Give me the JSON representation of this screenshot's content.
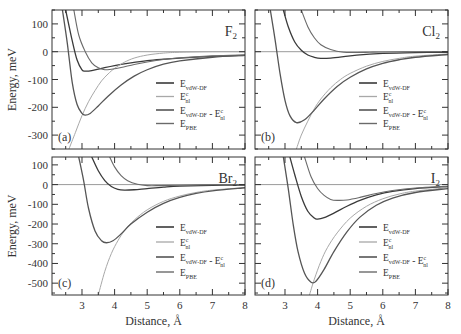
{
  "chart_data": [
    {
      "type": "line",
      "panel_tag": "(a)",
      "molecule": "F",
      "molecule_sub": "2",
      "xlim": [
        2.08,
        8
      ],
      "ylim": [
        -350,
        150
      ],
      "yticks": [
        100,
        0,
        -100,
        -200,
        -300
      ],
      "xticks": [
        3,
        4,
        5,
        6,
        7,
        8
      ],
      "show_x_tick_labels": false,
      "show_y_tick_labels": true,
      "ylabel": "Energy, meV",
      "series": [
        {
          "name": "E_vdW-DF",
          "x": [
            2.5,
            2.7,
            2.85,
            3.0,
            3.1,
            3.3,
            3.6,
            4.0,
            4.5,
            5.0,
            5.5,
            6.0,
            7.0,
            8.0
          ],
          "values": [
            150,
            40,
            -30,
            -65,
            -70,
            -68,
            -60,
            -50,
            -40,
            -32,
            -27,
            -23,
            -17,
            -13
          ]
        },
        {
          "name": "E_nl^c",
          "x": [
            2.6,
            2.8,
            3.0,
            3.2,
            3.4,
            3.6,
            3.8,
            4.0,
            4.3,
            4.6,
            5.0,
            5.5,
            6.0,
            7.0,
            8.0
          ],
          "values": [
            -350,
            -290,
            -230,
            -180,
            -140,
            -105,
            -80,
            -60,
            -38,
            -23,
            -12,
            -5,
            -2,
            0,
            0
          ]
        },
        {
          "name": "E_vdW-DF - E_nl^c",
          "x": [
            2.4,
            2.55,
            2.7,
            2.85,
            3.0,
            3.1,
            3.25,
            3.5,
            3.8,
            4.2,
            4.6,
            5.0,
            5.5,
            6.0,
            7.0,
            8.0
          ],
          "values": [
            150,
            30,
            -110,
            -190,
            -222,
            -228,
            -222,
            -195,
            -160,
            -120,
            -88,
            -65,
            -45,
            -33,
            -20,
            -13
          ]
        },
        {
          "name": "E_PBE",
          "x": [
            2.75,
            2.9,
            3.1,
            3.3,
            3.5,
            3.7,
            3.9,
            4.2,
            4.6,
            5.0,
            5.5,
            6.0,
            7.0,
            8.0
          ],
          "values": [
            150,
            60,
            0,
            -40,
            -58,
            -65,
            -63,
            -57,
            -46,
            -37,
            -28,
            -22,
            -15,
            -11
          ]
        }
      ],
      "zero_line": true,
      "legend": "center-right"
    },
    {
      "type": "line",
      "panel_tag": "(b)",
      "molecule": "Cl",
      "molecule_sub": "2",
      "xlim": [
        2.08,
        8
      ],
      "ylim": [
        -350,
        150
      ],
      "yticks": [
        100,
        0,
        -100,
        -200,
        -300
      ],
      "xticks": [
        3,
        4,
        5,
        6,
        7,
        8
      ],
      "show_x_tick_labels": false,
      "show_y_tick_labels": false,
      "series": [
        {
          "name": "E_vdW-DF",
          "x": [
            2.95,
            3.1,
            3.3,
            3.5,
            3.7,
            3.9,
            4.1,
            4.4,
            4.8,
            5.2,
            6.0,
            7.0,
            8.0
          ],
          "values": [
            150,
            90,
            35,
            5,
            -12,
            -20,
            -24,
            -23,
            -18,
            -12,
            -6,
            -3,
            -2
          ]
        },
        {
          "name": "E_nl^c",
          "x": [
            3.35,
            3.5,
            3.7,
            3.9,
            4.1,
            4.4,
            4.7,
            5.0,
            5.5,
            6.0,
            6.5,
            7.0,
            8.0
          ],
          "values": [
            -350,
            -300,
            -250,
            -205,
            -170,
            -130,
            -100,
            -78,
            -52,
            -35,
            -24,
            -16,
            -8
          ]
        },
        {
          "name": "E_vdW-DF - E_nl^c",
          "x": [
            2.55,
            2.7,
            2.85,
            3.0,
            3.15,
            3.35,
            3.6,
            3.9,
            4.2,
            4.6,
            5.0,
            5.5,
            6.0,
            6.5,
            7.0,
            8.0
          ],
          "values": [
            150,
            40,
            -80,
            -175,
            -230,
            -255,
            -245,
            -210,
            -170,
            -125,
            -92,
            -62,
            -42,
            -29,
            -20,
            -10
          ]
        },
        {
          "name": "E_PBE",
          "x": [
            3.5,
            3.7,
            3.9,
            4.1,
            4.4,
            4.8,
            5.2,
            5.6,
            6.0,
            7.0,
            8.0
          ],
          "values": [
            150,
            90,
            50,
            25,
            8,
            -2,
            -3,
            -2,
            -1,
            0,
            0
          ]
        }
      ],
      "zero_line": true,
      "legend": "center-right"
    },
    {
      "type": "line",
      "panel_tag": "(c)",
      "molecule": "Br",
      "molecule_sub": "2",
      "xlim": [
        2.08,
        8
      ],
      "ylim": [
        -560,
        140
      ],
      "yticks": [
        100,
        0,
        -100,
        -200,
        -300,
        -400,
        -500
      ],
      "xticks": [
        3,
        4,
        5,
        6,
        7,
        8
      ],
      "show_x_tick_labels": true,
      "show_y_tick_labels": true,
      "xlabel": "Distance, Å",
      "ylabel": "Energy, meV",
      "series": [
        {
          "name": "E_vdW-DF",
          "x": [
            3.3,
            3.5,
            3.7,
            3.9,
            4.1,
            4.3,
            4.6,
            5.0,
            5.5,
            6.0,
            7.0,
            8.0
          ],
          "values": [
            140,
            70,
            20,
            -10,
            -24,
            -28,
            -26,
            -20,
            -13,
            -8,
            -4,
            -2
          ]
        },
        {
          "name": "E_nl^c",
          "x": [
            3.5,
            3.7,
            3.9,
            4.1,
            4.3,
            4.6,
            5.0,
            5.5,
            6.0,
            6.5,
            7.0,
            8.0
          ],
          "values": [
            -560,
            -440,
            -350,
            -285,
            -235,
            -180,
            -128,
            -85,
            -58,
            -40,
            -28,
            -15
          ]
        },
        {
          "name": "E_vdW-DF - E_nl^c",
          "x": [
            2.9,
            3.05,
            3.2,
            3.4,
            3.6,
            3.75,
            3.95,
            4.2,
            4.5,
            5.0,
            5.5,
            6.0,
            6.5,
            7.0,
            8.0
          ],
          "values": [
            140,
            20,
            -120,
            -235,
            -285,
            -295,
            -285,
            -250,
            -200,
            -140,
            -95,
            -65,
            -45,
            -32,
            -16
          ]
        },
        {
          "name": "E_PBE",
          "x": [
            3.85,
            4.0,
            4.2,
            4.4,
            4.7,
            5.0,
            5.4,
            6.0,
            7.0,
            8.0
          ],
          "values": [
            140,
            90,
            45,
            20,
            2,
            -5,
            -5,
            -3,
            -1,
            0
          ]
        }
      ],
      "zero_line": true,
      "legend": "center-right"
    },
    {
      "type": "line",
      "panel_tag": "(d)",
      "molecule": "I",
      "molecule_sub": "2",
      "xlim": [
        2.08,
        8
      ],
      "ylim": [
        -560,
        140
      ],
      "yticks": [
        100,
        0,
        -100,
        -200,
        -300,
        -400,
        -500
      ],
      "xticks": [
        3,
        4,
        5,
        6,
        7,
        8
      ],
      "show_x_tick_labels": true,
      "show_y_tick_labels": false,
      "xlabel": "Distance, Å",
      "series": [
        {
          "name": "E_vdW-DF",
          "x": [
            3.15,
            3.3,
            3.5,
            3.7,
            3.9,
            4.0,
            4.2,
            4.5,
            4.9,
            5.3,
            5.8,
            6.3,
            7.0,
            8.0
          ],
          "values": [
            140,
            50,
            -60,
            -135,
            -170,
            -175,
            -168,
            -145,
            -110,
            -80,
            -52,
            -34,
            -20,
            -10
          ]
        },
        {
          "name": "E_nl^c",
          "x": [
            3.75,
            3.9,
            4.1,
            4.3,
            4.6,
            5.0,
            5.5,
            6.0,
            6.5,
            7.0,
            8.0
          ],
          "values": [
            -560,
            -480,
            -390,
            -320,
            -245,
            -170,
            -110,
            -72,
            -48,
            -33,
            -16
          ]
        },
        {
          "name": "E_vdW-DF - E_nl^c",
          "x": [
            2.95,
            3.1,
            3.25,
            3.4,
            3.6,
            3.8,
            3.95,
            4.2,
            4.5,
            4.9,
            5.3,
            5.8,
            6.3,
            7.0,
            8.0
          ],
          "values": [
            140,
            -20,
            -200,
            -340,
            -450,
            -495,
            -490,
            -430,
            -340,
            -240,
            -165,
            -105,
            -68,
            -40,
            -20
          ]
        },
        {
          "name": "E_PBE",
          "x": [
            3.6,
            3.8,
            4.0,
            4.2,
            4.4,
            4.6,
            4.9,
            5.3,
            5.8,
            6.3,
            7.0,
            8.0
          ],
          "values": [
            140,
            40,
            -20,
            -55,
            -75,
            -80,
            -78,
            -65,
            -45,
            -30,
            -17,
            -8
          ]
        }
      ],
      "zero_line": true,
      "legend": "center-right"
    }
  ],
  "legend_entries": [
    {
      "main": "E",
      "sub": "vdW-DF",
      "sup": "",
      "tail": "",
      "tail_sub": "",
      "tail_sup": ""
    },
    {
      "main": "E",
      "sub": "nl",
      "sup": "c",
      "tail": "",
      "tail_sub": "",
      "tail_sup": ""
    },
    {
      "main": "E",
      "sub": "vdW-DF",
      "sup": "",
      "tail": " - E",
      "tail_sub": "nl",
      "tail_sup": "c"
    },
    {
      "main": "E",
      "sub": "PBE",
      "sup": "",
      "tail": "",
      "tail_sub": "",
      "tail_sup": ""
    }
  ],
  "colors": {
    "E_vdW-DF": "#3a3a3a",
    "E_nl^c": "#a8a8a8",
    "E_vdW-DF - E_nl^c": "#555555",
    "E_PBE": "#6a6a6a",
    "zero_line": "#9a9a9a",
    "axis": "#333333"
  }
}
